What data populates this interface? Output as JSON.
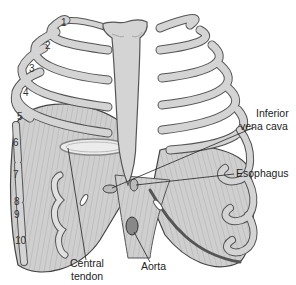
{
  "figure": {
    "colors": {
      "bone_fill": "#d4d4d4",
      "bone_stroke": "#555555",
      "muscle_fill": "#c9c9c9",
      "tendon_fill": "#e2e2e2",
      "line": "#333333",
      "background": "#ffffff"
    },
    "rib_numbers": [
      "1",
      "2",
      "3",
      "4",
      "5",
      "6",
      "7",
      "8",
      "9",
      "10"
    ],
    "labels": {
      "inferior_vena_cava_line1": "Inferior",
      "inferior_vena_cava_line2": "vena cava",
      "esophagus": "Esophagus",
      "central_tendon_line1": "Central",
      "central_tendon_line2": "tendon",
      "aorta": "Aorta"
    }
  }
}
